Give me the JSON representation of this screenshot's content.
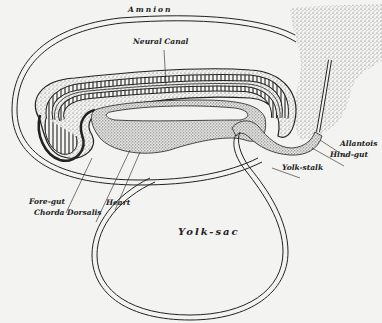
{
  "figure": {
    "colors": {
      "background": "#f3f3f1",
      "ink": "#222222",
      "stipple": "#555555"
    },
    "labels": {
      "amnion": "Amnion",
      "neural_canal": "Neural Canal",
      "allantois": "Allantois",
      "hind_gut": "Hind-gut",
      "yolk_stalk": "Yolk-stalk",
      "fore_gut": "Fore-gut",
      "chorda_dorsalis": "Chorda Dorsalis",
      "heart": "Heart",
      "yolk_sac": "Yolk-sac"
    }
  }
}
